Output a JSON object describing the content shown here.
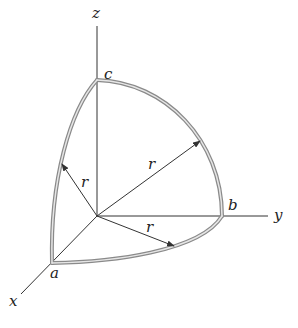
{
  "diagram": {
    "type": "3d-coordinate-sketch",
    "axes": {
      "x": "x",
      "y": "y",
      "z": "z"
    },
    "points": {
      "a": "a",
      "b": "b",
      "c": "c"
    },
    "radius_label": "r",
    "radius_labels": [
      "r",
      "r",
      "r"
    ],
    "colors": {
      "axis": "#333333",
      "arc_outer": "#8a8a8a",
      "arc_inner": "#e6e6e6",
      "arrow": "#333333"
    }
  }
}
